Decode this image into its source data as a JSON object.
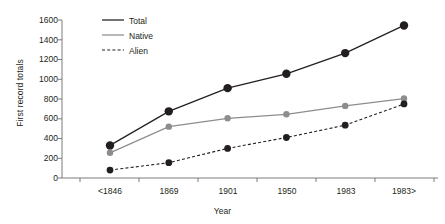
{
  "chart_data": {
    "type": "line",
    "title": "",
    "xlabel": "Year",
    "ylabel": "First record totals",
    "categories": [
      "<1846",
      "1869",
      "1901",
      "1950",
      "1983",
      "1983>"
    ],
    "ylim": [
      0,
      1600
    ],
    "yticks": [
      0,
      200,
      400,
      600,
      800,
      1000,
      1200,
      1400,
      1600
    ],
    "ytick_labels": [
      "0",
      "200",
      "400",
      "600",
      "800",
      "1000",
      "1200",
      "1400",
      "1600"
    ],
    "grid": false,
    "legend_position": "top-left-inside",
    "series": [
      {
        "name": "Total",
        "values": [
          330,
          675,
          910,
          1055,
          1265,
          1545
        ],
        "color": "#231f20",
        "style": "solid",
        "marker": "circle",
        "marker_size": 4.2
      },
      {
        "name": "Native",
        "values": [
          255,
          520,
          605,
          645,
          730,
          805
        ],
        "color": "#8d8d8d",
        "style": "solid",
        "marker": "circle",
        "marker_size": 3.2
      },
      {
        "name": "Alien",
        "values": [
          80,
          155,
          300,
          410,
          535,
          750
        ],
        "color": "#231f20",
        "style": "dashed",
        "marker": "circle",
        "marker_size": 3.4
      }
    ]
  },
  "axes": {
    "y_title": "First record totals",
    "x_title": "Year",
    "axis_color": "#6d6e71"
  },
  "legend": {
    "items": [
      {
        "label": "Total"
      },
      {
        "label": "Native"
      },
      {
        "label": "Alien"
      }
    ]
  }
}
